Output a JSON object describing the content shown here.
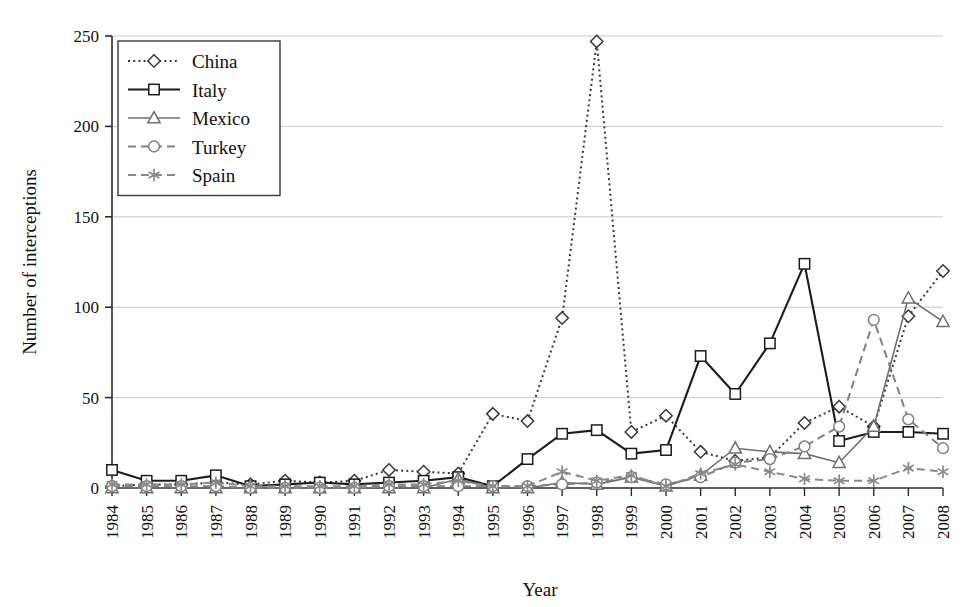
{
  "chart_data": {
    "type": "line",
    "title": "",
    "subtitle": "",
    "xlabel": "Year",
    "ylabel": "Number of interceptions",
    "grid": "horizontal",
    "legend_position": "top-left",
    "xlim": [
      1984,
      2008
    ],
    "ylim": [
      0,
      250
    ],
    "yticks": [
      0,
      50,
      100,
      150,
      200,
      250
    ],
    "ytick_labels": [
      "0",
      "50",
      "100",
      "150",
      "200",
      "250"
    ],
    "x": [
      1984,
      1985,
      1986,
      1987,
      1988,
      1989,
      1990,
      1991,
      1992,
      1993,
      1994,
      1995,
      1996,
      1997,
      1998,
      1999,
      2000,
      2001,
      2002,
      2003,
      2004,
      2005,
      2006,
      2007,
      2008
    ],
    "xtick_labels": [
      "1984",
      "1985",
      "1986",
      "1987",
      "1988",
      "1989",
      "1990",
      "1991",
      "1992",
      "1993",
      "1994",
      "1995",
      "1996",
      "1997",
      "1998",
      "1999",
      "2000",
      "2001",
      "2002",
      "2003",
      "2004",
      "2005",
      "2006",
      "2007",
      "2008"
    ],
    "series": [
      {
        "name": "China",
        "color": "#3a3a3a",
        "line_style": "dotted",
        "marker": "diamond",
        "values": [
          1,
          2,
          2,
          3,
          2,
          4,
          3,
          4,
          10,
          9,
          8,
          41,
          37,
          94,
          247,
          31,
          40,
          20,
          15,
          17,
          36,
          45,
          34,
          95,
          120
        ]
      },
      {
        "name": "Italy",
        "color": "#1c1c1c",
        "line_style": "solid",
        "marker": "square",
        "values": [
          10,
          4,
          4,
          7,
          1,
          2,
          3,
          2,
          3,
          4,
          6,
          1,
          16,
          30,
          32,
          19,
          21,
          73,
          52,
          80,
          124,
          26,
          31,
          31,
          30
        ]
      },
      {
        "name": "Mexico",
        "color": "#6f6f6f",
        "line_style": "solid",
        "marker": "triangle",
        "values": [
          0,
          0,
          0,
          0,
          0,
          0,
          0,
          0,
          0,
          0,
          5,
          0,
          0,
          3,
          2,
          6,
          1,
          7,
          22,
          20,
          19,
          14,
          34,
          105,
          92
        ]
      },
      {
        "name": "Turkey",
        "color": "#808080",
        "line_style": "dashed",
        "marker": "circle",
        "values": [
          1,
          1,
          1,
          1,
          0,
          0,
          0,
          0,
          1,
          1,
          1,
          1,
          1,
          2,
          3,
          6,
          2,
          6,
          14,
          16,
          23,
          34,
          93,
          38,
          22
        ]
      },
      {
        "name": "Spain",
        "color": "#8a8a8a",
        "line_style": "dashed",
        "marker": "asterisk",
        "values": [
          2,
          2,
          2,
          3,
          1,
          1,
          1,
          1,
          2,
          2,
          4,
          1,
          1,
          9,
          4,
          7,
          1,
          8,
          13,
          9,
          5,
          4,
          4,
          11,
          9
        ]
      }
    ]
  },
  "axes": {
    "ylabel": "Number of interceptions",
    "xlabel": "Year"
  },
  "legend": {
    "items": [
      {
        "label": "China"
      },
      {
        "label": "Italy"
      },
      {
        "label": "Mexico"
      },
      {
        "label": "Turkey"
      },
      {
        "label": "Spain"
      }
    ]
  }
}
